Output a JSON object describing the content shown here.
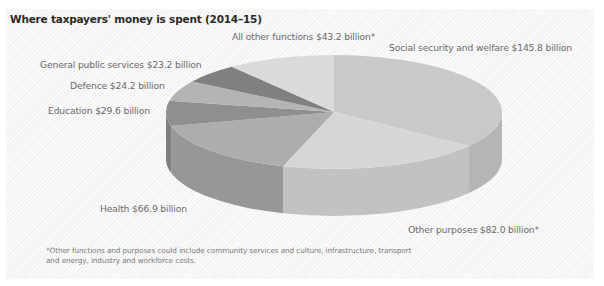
{
  "chart_data": {
    "type": "pie",
    "style": "3d",
    "title": "Where taxpayers' money is spent (2014–15)",
    "unit": "billion AUD",
    "slices": [
      {
        "label": "Social security and welfare",
        "value": 145.8,
        "display": "Social security and welfare $145.8 billion",
        "color": "#c9c9c9",
        "side": "#b5b5b5"
      },
      {
        "label": "Other purposes",
        "value": 82.0,
        "display": "Other purposes $82.0 billion*",
        "color": "#d6d6d6",
        "side": "#c2c2c2"
      },
      {
        "label": "Health",
        "value": 66.9,
        "display": "Health $66.9 billion",
        "color": "#adadad",
        "side": "#979797"
      },
      {
        "label": "Education",
        "value": 29.6,
        "display": "Education $29.6 billion",
        "color": "#8f8f8f",
        "side": "#7e7e7e"
      },
      {
        "label": "Defence",
        "value": 24.2,
        "display": "Defence $24.2 billion",
        "color": "#b4b4b4",
        "side": "#a0a0a0"
      },
      {
        "label": "General public services",
        "value": 23.2,
        "display": "General public services $23.2 billion",
        "color": "#808080",
        "side": "#707070"
      },
      {
        "label": "All other functions",
        "value": 43.2,
        "display": "All other functions $43.2 billion*",
        "color": "#dadada",
        "side": "#c6c6c6"
      }
    ],
    "total": 414.9,
    "start_angle_deg": -90,
    "direction": "clockwise",
    "footnote": "*Other functions and purposes could include community services and culture, infrastructure, transport and energy, industry and workforce costs."
  },
  "labels": {
    "title": "Where taxpayers' money is spent (2014–15)",
    "all_other": "All other functions $43.2 billion*",
    "social": "Social security and welfare $145.8 billion",
    "general": "General public services $23.2 billion",
    "defence": "Defence $24.2 billion",
    "education": "Education $29.6 billion",
    "health": "Health $66.9 billion",
    "other_purposes": "Other purposes $82.0 billion*",
    "footnote_line1": "*Other functions and purposes could include community services and culture, infrastructure, transport",
    "footnote_line2": "and energy, industry and workforce costs."
  }
}
